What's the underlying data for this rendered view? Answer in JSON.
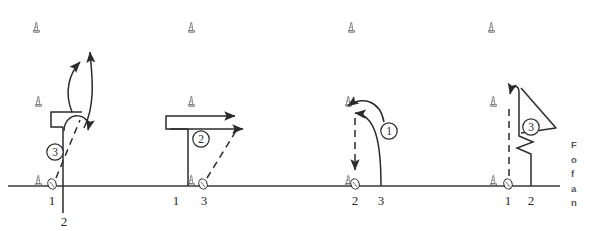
{
  "figure": {
    "type": "sports-drill-diagram",
    "baseline": {
      "y": 186,
      "x_start": 8,
      "x_end": 560,
      "color": "#3a3a3a"
    },
    "colors": {
      "ink": "#2b2b2b",
      "cone": "#6e6e73",
      "baseline": "#3a3a3a",
      "caption": "#55555a",
      "background": "#ffffff"
    },
    "cones": [
      {
        "id": "cone-r1-c1",
        "x": 33,
        "y": 22,
        "row": 1
      },
      {
        "id": "cone-r1-c2",
        "x": 188,
        "y": 22,
        "row": 1
      },
      {
        "id": "cone-r1-c3",
        "x": 348,
        "y": 22,
        "row": 1
      },
      {
        "id": "cone-r1-c4",
        "x": 488,
        "y": 22,
        "row": 1
      },
      {
        "id": "cone-r2-c1",
        "x": 35,
        "y": 96,
        "row": 2
      },
      {
        "id": "cone-r2-c2",
        "x": 188,
        "y": 96,
        "row": 2
      },
      {
        "id": "cone-r2-c3",
        "x": 345,
        "y": 96,
        "row": 2
      },
      {
        "id": "cone-r2-c4",
        "x": 490,
        "y": 96,
        "row": 2
      },
      {
        "id": "cone-r3-c1",
        "x": 35,
        "y": 175,
        "row": 3
      },
      {
        "id": "cone-r3-c2",
        "x": 188,
        "y": 175,
        "row": 3
      },
      {
        "id": "cone-r3-c3",
        "x": 345,
        "y": 175,
        "row": 3
      },
      {
        "id": "cone-r3-c4",
        "x": 490,
        "y": 175,
        "row": 3
      }
    ],
    "panels": [
      {
        "id": "panel-1",
        "step_label": "3",
        "step_x": 55,
        "step_y": 152,
        "ball_x": 52,
        "ball_y": 184,
        "position_labels": [
          {
            "text": "1",
            "x": 52,
            "y": 200
          },
          {
            "text": "2",
            "x": 64,
            "y": 221
          }
        ]
      },
      {
        "id": "panel-2",
        "step_label": "2",
        "step_x": 201,
        "step_y": 139,
        "ball_x": 203,
        "ball_y": 184,
        "position_labels": [
          {
            "text": "1",
            "x": 176,
            "y": 200
          },
          {
            "text": "3",
            "x": 204,
            "y": 200
          }
        ]
      },
      {
        "id": "panel-3",
        "step_label": "1",
        "step_x": 389,
        "step_y": 131,
        "ball_x": 355,
        "ball_y": 184,
        "position_labels": [
          {
            "text": "2",
            "x": 355,
            "y": 200
          },
          {
            "text": "3",
            "x": 381,
            "y": 200
          }
        ]
      },
      {
        "id": "panel-4",
        "step_label": "3",
        "step_x": 531,
        "step_y": 127,
        "ball_x": 508,
        "ball_y": 184,
        "position_labels": [
          {
            "text": "1",
            "x": 508,
            "y": 200
          },
          {
            "text": "2",
            "x": 531,
            "y": 200
          }
        ]
      }
    ],
    "caption_fragment": {
      "clipped": true,
      "lines": [
        "F",
        "o",
        "f",
        "a",
        "n"
      ]
    }
  }
}
